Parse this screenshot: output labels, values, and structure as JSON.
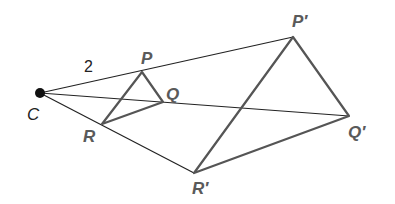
{
  "diagram": {
    "center": {
      "label": "C",
      "x": 40,
      "y": 93
    },
    "scale_label": "2",
    "original": {
      "P": {
        "label": "P",
        "x": 142,
        "y": 72
      },
      "Q": {
        "label": "Q",
        "x": 163,
        "y": 102
      },
      "R": {
        "label": "R",
        "x": 102,
        "y": 124
      }
    },
    "image": {
      "P": {
        "label": "P′",
        "x": 293,
        "y": 37
      },
      "Q": {
        "label": "Q′",
        "x": 349,
        "y": 116
      },
      "R": {
        "label": "R′",
        "x": 194,
        "y": 173
      }
    },
    "colors": {
      "rays": "#222222",
      "triangles": "#555555",
      "labels": "#5a5a5a"
    }
  }
}
